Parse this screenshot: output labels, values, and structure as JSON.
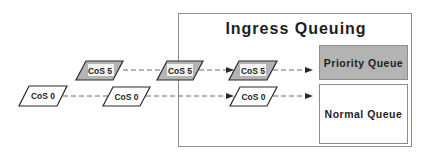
{
  "diagram": {
    "title": "Ingress Queuing",
    "colors": {
      "gray_fill": "#b4b4b4",
      "white_fill": "#ffffff",
      "stroke": "#2a2a2a",
      "box_stroke": "#8c8c8c",
      "dash": "#6a6a6a",
      "text": "#1e1e1e"
    },
    "queues": [
      {
        "label": "Priority Queue",
        "fill": "gray"
      },
      {
        "label": "Normal Queue",
        "fill": "white"
      }
    ],
    "packets": {
      "cos5": [
        {
          "label": "CoS 5"
        },
        {
          "label": "CoS 5"
        },
        {
          "label": "CoS 5"
        }
      ],
      "cos0": [
        {
          "label": "CoS 0"
        },
        {
          "label": "CoS 0"
        },
        {
          "label": "CoS 0"
        }
      ]
    }
  }
}
